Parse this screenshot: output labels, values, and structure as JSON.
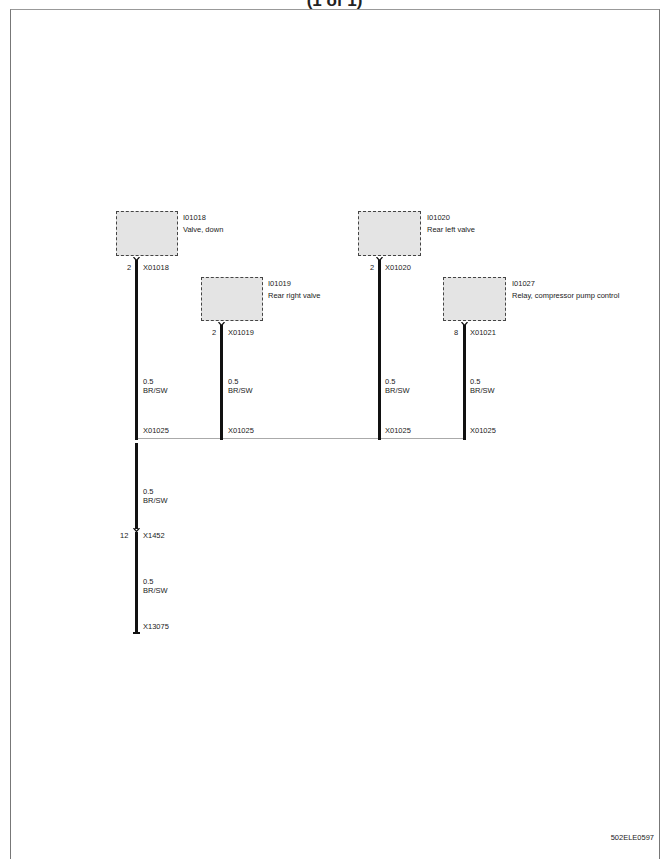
{
  "header": {
    "title": "(1 of 1)"
  },
  "components": [
    {
      "id": "I01018",
      "name": "Valve, down",
      "connector": "X01018",
      "pin": "2"
    },
    {
      "id": "I01019",
      "name": "Rear right  valve",
      "connector": "X01019",
      "pin": "2"
    },
    {
      "id": "I01020",
      "name": "Rear left valve",
      "connector": "X01020",
      "pin": "2"
    },
    {
      "id": "I01027",
      "name": "Relay, compressor pump control",
      "connector": "X01021",
      "pin": "8"
    }
  ],
  "wires": [
    {
      "size": "0.5",
      "color": "BR/SW"
    },
    {
      "size": "0.5",
      "color": "BR/SW"
    },
    {
      "size": "0.5",
      "color": "BR/SW"
    },
    {
      "size": "0.5",
      "color": "BR/SW"
    },
    {
      "size": "0.5",
      "color": "BR/SW"
    },
    {
      "size": "0.5",
      "color": "BR/SW"
    }
  ],
  "splices": [
    "X01025",
    "X01025",
    "X01025",
    "X01025"
  ],
  "connectors": {
    "inline": {
      "id": "X1452",
      "pin": "12"
    },
    "ground": {
      "id": "X13075"
    }
  },
  "footer": {
    "code": "502ELE0597"
  }
}
